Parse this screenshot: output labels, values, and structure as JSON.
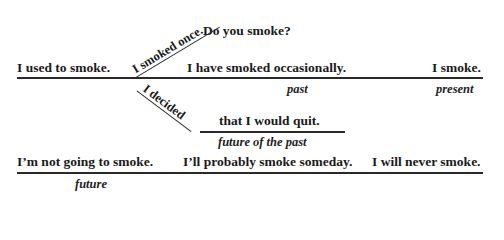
{
  "diagram": {
    "timelines": {
      "main": {
        "sentences": [
          "I used to smoke.",
          "I have smoked occasionally.",
          "I smoke."
        ],
        "labels": {
          "past": "past",
          "present": "present"
        }
      },
      "branch_up": {
        "sentence": "I smoked once."
      },
      "question": {
        "sentence": "Do you smoke?"
      },
      "branch_down": {
        "sentence": "I decided",
        "continuation": "that I would quit.",
        "label": "future of the past"
      },
      "future": {
        "sentences": [
          "I’m not going to smoke.",
          "I’ll probably smoke someday.",
          "I will never smoke."
        ],
        "label": "future"
      }
    },
    "colors": {
      "ink": "#1a1a1a",
      "background": "#ffffff"
    }
  }
}
